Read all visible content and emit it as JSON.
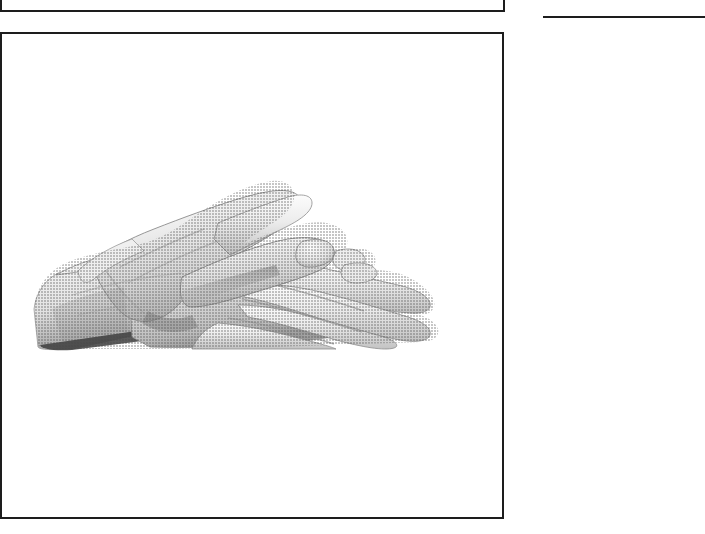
{
  "page": {
    "width": 705,
    "height": 534,
    "background_color": "#ffffff",
    "ink_color": "#1d1d1d",
    "medium": "scanned printed book page",
    "caption_text": ""
  },
  "top_frame": {
    "name": "cropped figure frame above",
    "description": "lower portion of a preceding bordered illustration frame, cropped by the page edge",
    "left": 0,
    "bottom_edge_y": 12,
    "right_edge_x": 505,
    "label": ""
  },
  "column_rule": {
    "name": "horizontal rule in right column",
    "left": 543,
    "top": 16,
    "width": 162,
    "label": ""
  },
  "figure_frame": {
    "name": "main illustration frame",
    "left": 0,
    "top": 32,
    "width": 504,
    "height": 487,
    "border_color": "#1d1d1d",
    "border_width_px": 2,
    "label": ""
  },
  "photograph": {
    "subject": "two hands, sign-language handshape",
    "description": "A flat open right hand rests palm-down atop a flat open left hand, fingers extended and pointing to the right; the upper hand's fingertips overlap the lower hand's knuckles. Black-and-white halftone photograph on a plain white ground.",
    "orientation": "fingers pointing right",
    "tone": "grayscale halftone",
    "highlight_color": "#f2f2f2",
    "midtone_color": "#d2d2d2",
    "shadow_color": "#8e8e8e",
    "deep_shadow_color": "#4a4a4a",
    "outline_color": "#6f6f6f",
    "caption": "",
    "bounds": {
      "left": 30,
      "top": 125,
      "width": 430,
      "height": 200
    }
  },
  "icons": {
    "hand_icon_name": "two-hands-sign-icon"
  }
}
